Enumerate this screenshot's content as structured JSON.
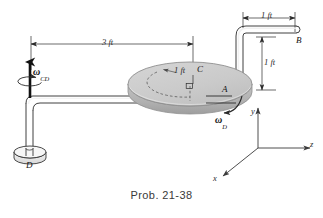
{
  "figure": {
    "caption": "Prob. 21-38",
    "background_color": "#ffffff",
    "line_color": "#2b2b2b",
    "disk_fill_color": "#cccccc",
    "disk_edge_color": "#b4b4b4"
  },
  "dimensions": [
    {
      "id": "span-3ft",
      "label": "3 ft",
      "orientation": "horizontal",
      "note": "from shaft CD axis to disk center C"
    },
    {
      "id": "top-1ft",
      "label": "1 ft",
      "orientation": "horizontal",
      "note": "horizontal rod segment to B"
    },
    {
      "id": "right-1ft",
      "label": "1 ft",
      "orientation": "vertical",
      "note": "vertical rod height above disk at A"
    },
    {
      "id": "radius-1ft",
      "label": "1 ft",
      "orientation": "radial",
      "note": "disk radius"
    }
  ],
  "points": [
    {
      "id": "A",
      "label": "A"
    },
    {
      "id": "B",
      "label": "B"
    },
    {
      "id": "C",
      "label": "C"
    },
    {
      "id": "D",
      "label": "D"
    }
  ],
  "angular_velocities": [
    {
      "id": "omega-cd",
      "symbol": "ω",
      "subscript": "CD",
      "note": "about vertical shaft at D"
    },
    {
      "id": "omega-d",
      "symbol": "ω",
      "subscript": "D",
      "note": "spin of disk about rod axis at A"
    }
  ],
  "axes": [
    {
      "id": "x",
      "label": "x"
    },
    {
      "id": "y",
      "label": "y"
    },
    {
      "id": "z",
      "label": "z"
    }
  ]
}
